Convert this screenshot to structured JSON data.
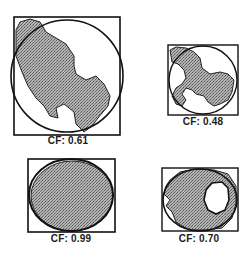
{
  "figure": {
    "panels": [
      {
        "id": "panel-1",
        "label": "CF: 0.61",
        "cf": 0.61
      },
      {
        "id": "panel-2",
        "label": "CF: 0.48",
        "cf": 0.48
      },
      {
        "id": "panel-3",
        "label": "CF: 0.99",
        "cf": 0.99
      },
      {
        "id": "panel-4",
        "label": "CF: 0.70",
        "cf": 0.7
      }
    ],
    "colors": {
      "outline": "#111111",
      "fill": "#9a9a9a",
      "background": "#ffffff"
    }
  }
}
